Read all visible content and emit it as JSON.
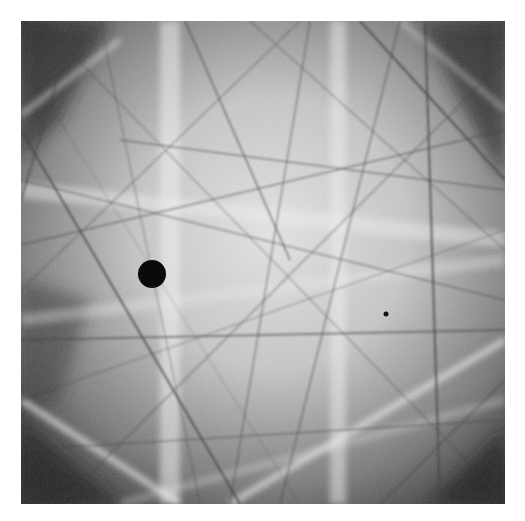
{
  "image": {
    "subject": "electron backscatter diffraction (Kikuchi) pattern",
    "tone": "grayscale",
    "frame": {
      "x": 21,
      "y": 21,
      "width": 484,
      "height": 483
    },
    "colors": {
      "background": "#ffffff",
      "center_light": "#e4e4e4",
      "corner_dark": "#2a2a2a",
      "line_dark": "#3a3a3a",
      "band_light": "#f2f2f2",
      "spot": "#0a0a0a"
    },
    "features": {
      "beam_stop_spot": {
        "cx": 152,
        "cy": 274,
        "r": 14
      },
      "small_dot": {
        "cx": 386,
        "cy": 314,
        "r": 2.5
      },
      "vertical_bright_bands": [
        {
          "x": 160,
          "width": 20
        },
        {
          "x": 330,
          "width": 16
        }
      ]
    }
  }
}
